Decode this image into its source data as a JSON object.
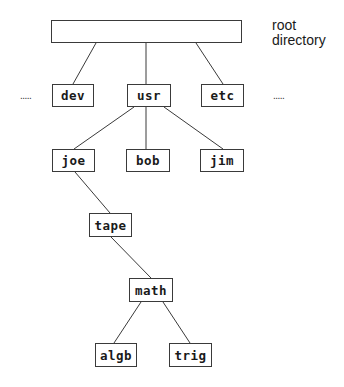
{
  "diagram": {
    "type": "directory-tree",
    "root_label": "root directory",
    "ellipsis_left": ".....",
    "ellipsis_right": ".....",
    "nodes": {
      "root": "",
      "dev": "dev",
      "usr": "usr",
      "etc": "etc",
      "joe": "joe",
      "bob": "bob",
      "jim": "jim",
      "tape": "tape",
      "math": "math",
      "algb": "algb",
      "trig": "trig"
    },
    "edges": [
      [
        "root",
        "dev"
      ],
      [
        "root",
        "usr"
      ],
      [
        "root",
        "etc"
      ],
      [
        "usr",
        "joe"
      ],
      [
        "usr",
        "bob"
      ],
      [
        "usr",
        "jim"
      ],
      [
        "joe",
        "tape"
      ],
      [
        "tape",
        "math"
      ],
      [
        "math",
        "algb"
      ],
      [
        "math",
        "trig"
      ]
    ],
    "colors": {
      "line": "#3a3a3a",
      "text": "#1a1a1a",
      "background": "#ffffff"
    }
  }
}
